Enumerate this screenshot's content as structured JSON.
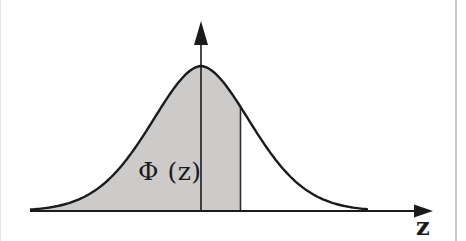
{
  "figure": {
    "type": "area-curve",
    "labels": {
      "area_label": "Φ (z)",
      "x_axis_label": "z"
    },
    "colors": {
      "background": "#ffffff",
      "ink": "#1b1b1b",
      "shade_fill": "#cccbc9",
      "boundary_line": "#2e2e2e",
      "left_page_edge": "#e8e8e8",
      "right_page_edge": "#c6c6c6",
      "label_ink": "#1b1b1b"
    },
    "geometry": {
      "width": 466,
      "height": 241,
      "baseline_y": 211,
      "x_axis": {
        "x_start": 30,
        "tip_x": 433,
        "head_len": 19,
        "head_half": 6.5,
        "stroke": 1.8
      },
      "y_axis": {
        "x": 201,
        "tip_y": 21,
        "head_len": 24,
        "head_half": 7,
        "stroke": 1.6
      },
      "curve": {
        "mean": 201,
        "peak_y": 66,
        "scale": 73,
        "power": 1.8,
        "x_start": 31,
        "x_end": 367,
        "stroke": 2.4
      },
      "shade_to_x": 240.5,
      "boundary_stroke": 1.6
    }
  }
}
